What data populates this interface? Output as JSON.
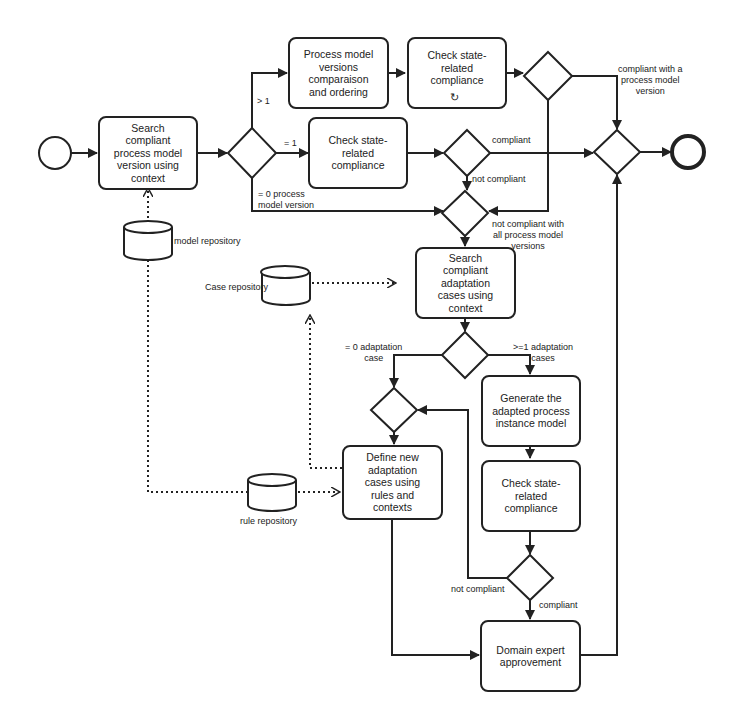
{
  "tasks": {
    "search_pmv": "Search\ncompliant\nprocess model\nversion using\ncontext",
    "pmv_compare": "Process model\nversions\ncomparaison\nand ordering",
    "check_loop": "Check state-\nrelated\ncompliance",
    "check_single": "Check state-\nrelated\ncompliance",
    "search_cases": "Search\ncompliant\nadaptation\ncases using\ncontext",
    "generate": "Generate the\nadapted process\ninstance model",
    "check_adapted": "Check state-\nrelated\ncompliance",
    "define_cases": "Define new\nadaptation\ncases using\nrules and\ncontexts",
    "expert": "Domain expert\napprovement"
  },
  "data_stores": {
    "model": "model repository",
    "case": "Case repository",
    "rule": "rule repository"
  },
  "flow_labels": {
    "gt1": "> 1",
    "eq1": "= 1",
    "eq0_pmv": "= 0 process\nmodel version",
    "compliant_top": "compliant",
    "not_compliant_top": "not compliant",
    "compliant_with_pmv": "compliant with a\nprocess model\nversion",
    "not_compliant_all": "not compliant with\nall process model\nversions",
    "eq0_cases": "= 0 adaptation\ncase",
    "ge1_cases": ">=1 adaptation\ncases",
    "not_compliant_bottom": "not compliant",
    "compliant_bottom": "compliant"
  },
  "icons": {
    "loop_marker": "↻"
  }
}
